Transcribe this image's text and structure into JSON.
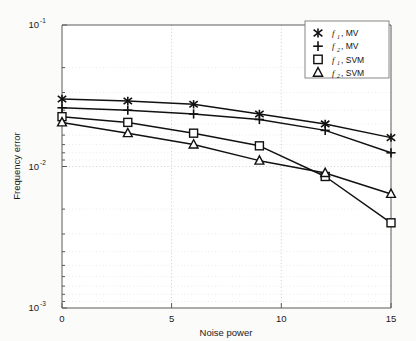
{
  "chart_data": {
    "type": "line",
    "title": "",
    "xlabel": "Noise power",
    "ylabel": "Frequency error",
    "x": [
      0,
      3,
      6,
      9,
      12,
      15
    ],
    "xlim": [
      0,
      15
    ],
    "ylim": [
      0.001,
      0.1
    ],
    "yscale": "log",
    "xticks": [
      "0",
      "5",
      "10",
      "15"
    ],
    "xtick_values": [
      0,
      5,
      10,
      15
    ],
    "yticks": [
      "10^-1",
      "10^-2",
      "10^-3"
    ],
    "ytick_values": [
      0.1,
      0.01,
      0.001
    ],
    "grid": true,
    "legend_position": "upper right",
    "series": [
      {
        "name": "f1, MV",
        "marker": "asterisk",
        "values": [
          0.03,
          0.029,
          0.0275,
          0.0235,
          0.02,
          0.016
        ]
      },
      {
        "name": "f2, MV",
        "marker": "plus",
        "values": [
          0.026,
          0.025,
          0.0235,
          0.0215,
          0.018,
          0.0125
        ]
      },
      {
        "name": "f1, SVM",
        "marker": "square",
        "values": [
          0.0225,
          0.0205,
          0.0172,
          0.014,
          0.0085,
          0.004
        ]
      },
      {
        "name": "f2, SVM",
        "marker": "triangle",
        "values": [
          0.0205,
          0.0172,
          0.0143,
          0.011,
          0.009,
          0.0064
        ]
      }
    ]
  },
  "axes": {
    "x_label": "Noise power",
    "y_label": "Frequency error",
    "x_tick_labels": [
      "0",
      "5",
      "10",
      "15"
    ],
    "y_tick_base": "10",
    "y_tick_exponents": [
      "-1",
      "-2",
      "-3"
    ]
  },
  "legend": {
    "entries": [
      {
        "symbol": "f",
        "sub": "1",
        "suffix": ", MV",
        "marker": "asterisk"
      },
      {
        "symbol": "f",
        "sub": "2",
        "suffix": ", MV",
        "marker": "plus"
      },
      {
        "symbol": "f",
        "sub": "1",
        "suffix": ", SVM",
        "marker": "square"
      },
      {
        "symbol": "f",
        "sub": "2",
        "suffix": ", SVM",
        "marker": "triangle"
      }
    ]
  },
  "colors": {
    "line": "#111111",
    "grid": "#c9c9c9",
    "axis": "#5a5a5a",
    "background": "#fbfbfa"
  }
}
